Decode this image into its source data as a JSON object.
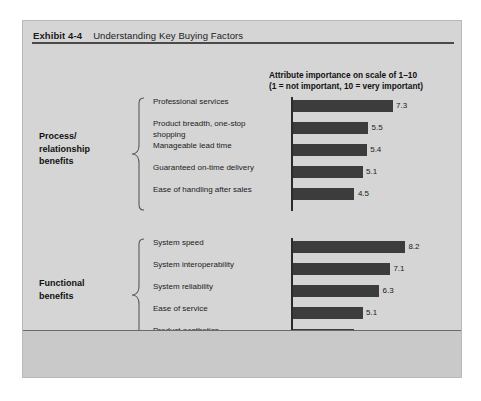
{
  "exhibit": {
    "number_label": "Exhibit 4-4",
    "title": "Understanding Key Buying Factors"
  },
  "colors": {
    "panel_background": "#d5d5d5",
    "footer_background": "#c9c9c9",
    "bar_fill": "#3c3c3c",
    "axis": "#2b2b2b",
    "title_rule": "#4a4a4a",
    "text": "#1b1b1b"
  },
  "chart_data": {
    "type": "bar",
    "orientation": "horizontal",
    "title": "Understanding Key Buying Factors",
    "subtitle": "",
    "caption_line1": "Attribute importance on scale of 1–10",
    "caption_line2": "(1 = not important, 10 = very important)",
    "xlabel": "Attribute importance on scale of 1–10",
    "ylabel": "",
    "xlim": [
      0,
      10
    ],
    "grid": false,
    "legend": null,
    "groups": [
      {
        "name": "Process/\nrelationship\nbenefits",
        "label_line1": "Process/",
        "label_line2": "relationship",
        "label_line3": "benefits",
        "categories": [
          "Professional services",
          "Product breadth, one-stop shopping",
          "Manageable lead time",
          "Guaranteed on-time delivery",
          "Ease of handling after sales"
        ],
        "values": [
          7.3,
          5.5,
          5.4,
          5.1,
          4.5
        ],
        "value_labels": [
          "7.3",
          "5.5",
          "5.4",
          "5.1",
          "4.5"
        ]
      },
      {
        "name": "Functional\nbenefits",
        "label_line1": "Functional",
        "label_line2": "benefits",
        "label_line3": "",
        "categories": [
          "System speed",
          "System interoperability",
          "System reliability",
          "Ease of service",
          "Product aesthetics"
        ],
        "values": [
          8.2,
          7.1,
          6.3,
          5.1,
          4.5
        ],
        "value_labels": [
          "8.2",
          "7.1",
          "6.3",
          "5.1",
          "4.5"
        ]
      }
    ]
  }
}
